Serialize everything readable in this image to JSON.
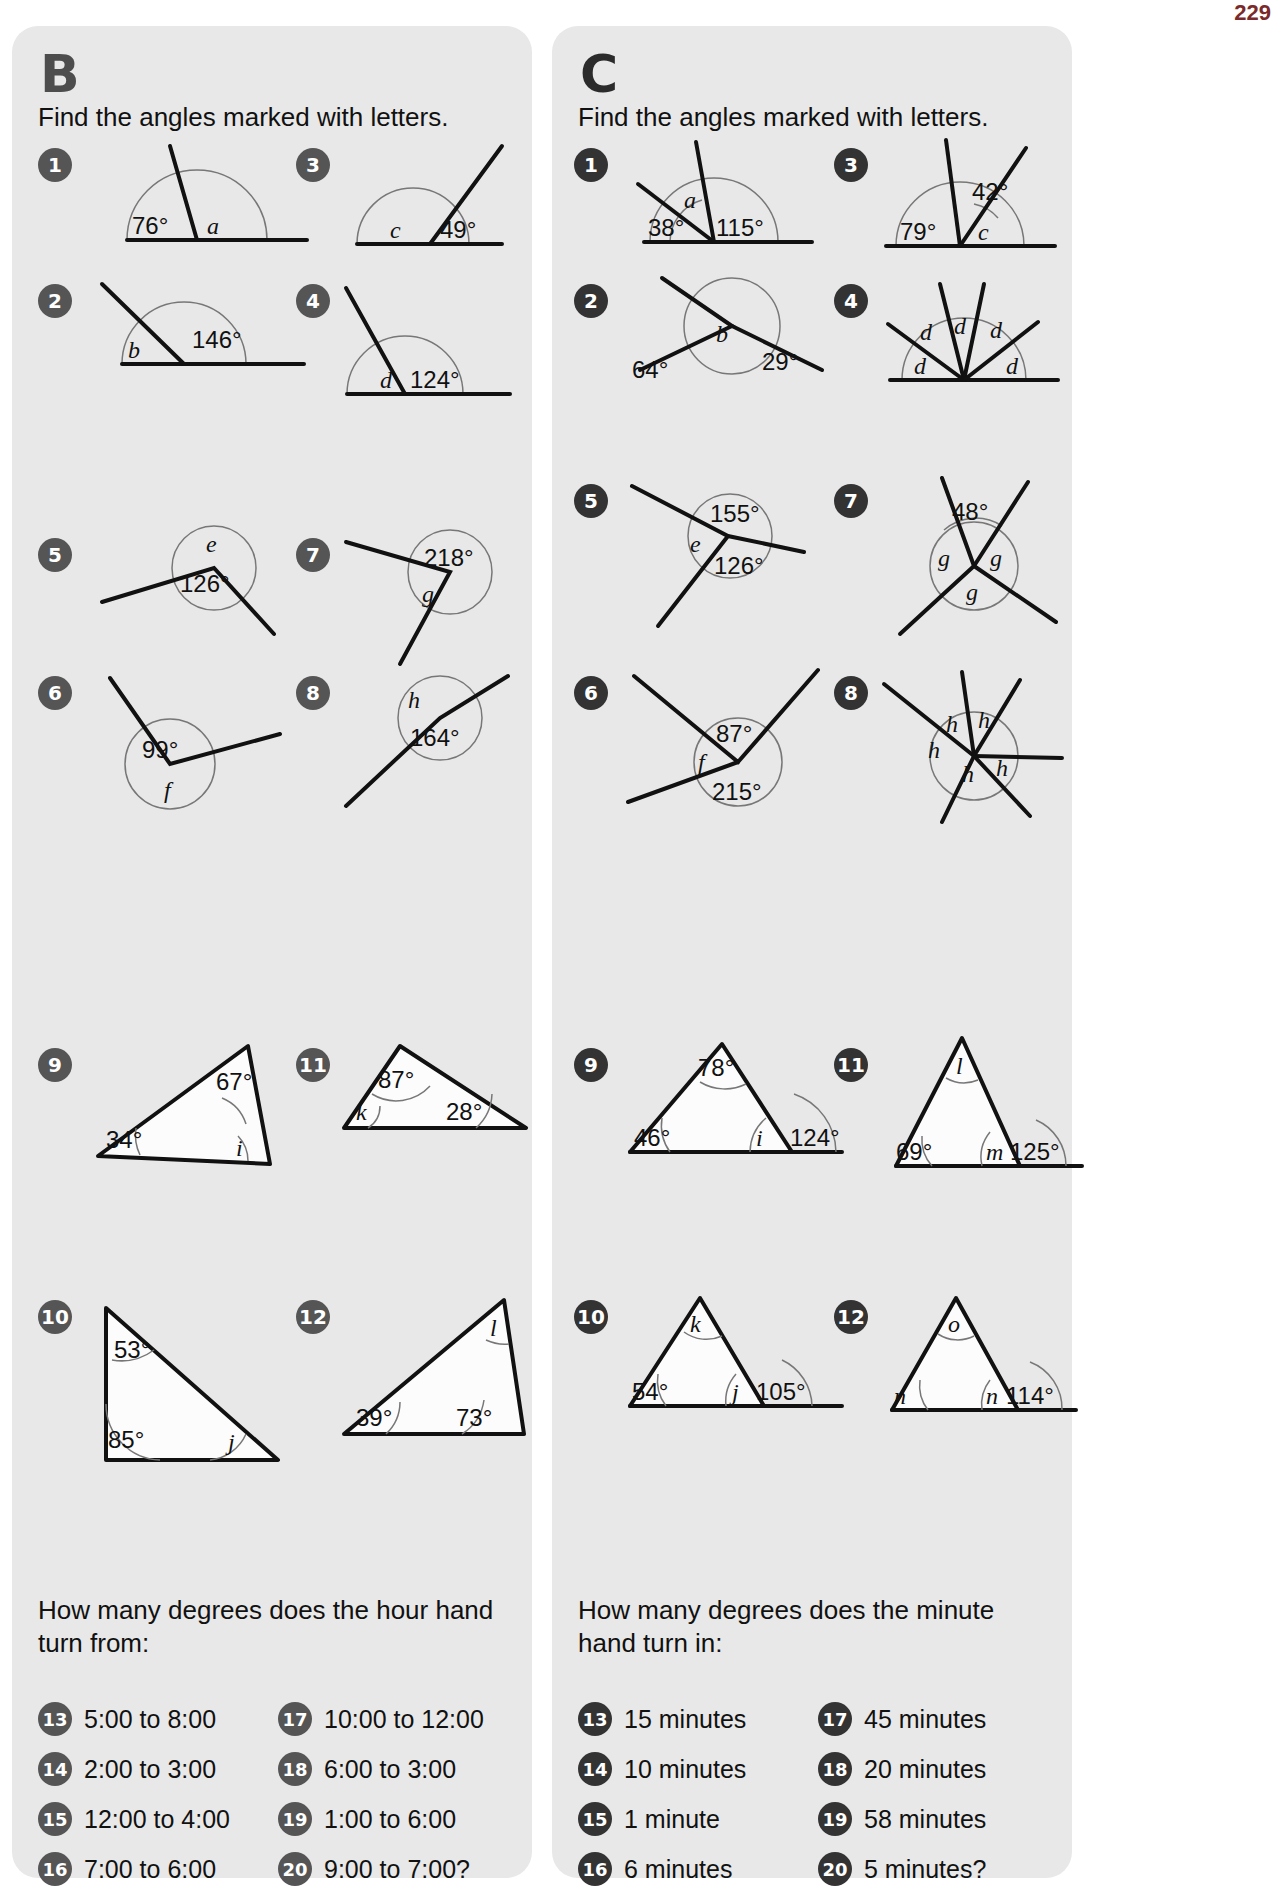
{
  "page": {
    "number": "229"
  },
  "sections": [
    {
      "letter": "B",
      "instruction": "Find the angles marked with letters.",
      "items": [
        {
          "n": "1",
          "labels": [
            "76°",
            "a"
          ]
        },
        {
          "n": "2",
          "labels": [
            "b",
            "146°"
          ]
        },
        {
          "n": "3",
          "labels": [
            "c",
            "49°"
          ]
        },
        {
          "n": "4",
          "labels": [
            "d",
            "124°"
          ]
        },
        {
          "n": "5",
          "labels": [
            "e",
            "126°"
          ]
        },
        {
          "n": "6",
          "labels": [
            "99°",
            "f"
          ]
        },
        {
          "n": "7",
          "labels": [
            "218°",
            "g"
          ]
        },
        {
          "n": "8",
          "labels": [
            "h",
            "164°"
          ]
        },
        {
          "n": "9",
          "labels": [
            "67°",
            "34°",
            "i"
          ]
        },
        {
          "n": "10",
          "labels": [
            "53°",
            "85°",
            "j"
          ]
        },
        {
          "n": "11",
          "labels": [
            "87°",
            "k",
            "28°"
          ]
        },
        {
          "n": "12",
          "labels": [
            "l",
            "39°",
            "73°"
          ]
        }
      ],
      "bottom_question": "How many degrees does the hour hand turn from:",
      "bottom_items": [
        {
          "n": "13",
          "text": "5:00 to 8:00"
        },
        {
          "n": "17",
          "text": "10:00 to 12:00"
        },
        {
          "n": "14",
          "text": "2:00 to 3:00"
        },
        {
          "n": "18",
          "text": "6:00 to 3:00"
        },
        {
          "n": "15",
          "text": "12:00 to 4:00"
        },
        {
          "n": "19",
          "text": "1:00 to 6:00"
        },
        {
          "n": "16",
          "text": "7:00 to 6:00"
        },
        {
          "n": "20",
          "text": "9:00 to 7:00?"
        }
      ]
    },
    {
      "letter": "C",
      "instruction": "Find the angles marked with letters.",
      "items": [
        {
          "n": "1",
          "labels": [
            "a",
            "38°",
            "115°"
          ]
        },
        {
          "n": "2",
          "labels": [
            "64°",
            "b",
            "29°"
          ]
        },
        {
          "n": "3",
          "labels": [
            "42°",
            "79°",
            "c"
          ]
        },
        {
          "n": "4",
          "labels": [
            "d",
            "d",
            "d",
            "d",
            "d"
          ]
        },
        {
          "n": "5",
          "labels": [
            "155°",
            "e",
            "126°"
          ]
        },
        {
          "n": "6",
          "labels": [
            "87°",
            "f",
            "215°"
          ]
        },
        {
          "n": "7",
          "labels": [
            "48°",
            "g",
            "g",
            "g"
          ]
        },
        {
          "n": "8",
          "labels": [
            "h",
            "h",
            "h",
            "h",
            "h"
          ]
        },
        {
          "n": "9",
          "labels": [
            "78°",
            "46°",
            "i",
            "124°"
          ]
        },
        {
          "n": "10",
          "labels": [
            "k",
            "54°",
            "j",
            "105°"
          ]
        },
        {
          "n": "11",
          "labels": [
            "l",
            "69°",
            "m",
            "125°"
          ]
        },
        {
          "n": "12",
          "labels": [
            "o",
            "n",
            "n",
            "114°"
          ]
        }
      ],
      "bottom_question": "How many degrees does the minute hand turn in:",
      "bottom_items": [
        {
          "n": "13",
          "text": "15 minutes"
        },
        {
          "n": "17",
          "text": "45 minutes"
        },
        {
          "n": "14",
          "text": "10 minutes"
        },
        {
          "n": "18",
          "text": "20 minutes"
        },
        {
          "n": "15",
          "text": "1 minute"
        },
        {
          "n": "19",
          "text": "58 minutes"
        },
        {
          "n": "16",
          "text": "6 minutes"
        },
        {
          "n": "20",
          "text": "5 minutes?"
        }
      ]
    }
  ]
}
